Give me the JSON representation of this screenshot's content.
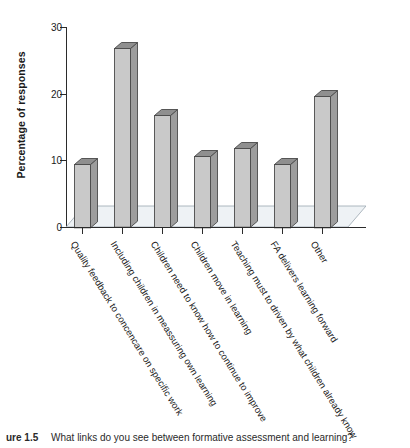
{
  "chart_data": {
    "type": "bar",
    "title": "",
    "xlabel": "",
    "ylabel": "Percentage of responses",
    "ylim": [
      0,
      30
    ],
    "yticks": [
      0,
      10,
      20,
      30
    ],
    "grid": false,
    "legend": null,
    "style": "3d-column",
    "categories": [
      "Quality feedback to concencare on specific work",
      "Including children in meassuring own learning",
      "Children need to know how to continue to improve",
      "Children move in learning",
      "Teaching must to driven by what children already know",
      "FA delivers learning forward",
      "Other"
    ],
    "values": [
      9.5,
      26.8,
      16.8,
      10.7,
      11.8,
      9.5,
      19.7
    ],
    "value_unit": "%"
  },
  "axis": {
    "y_title": "Percentage of responses",
    "y_tick_labels": [
      "0",
      "10",
      "20",
      "30"
    ]
  },
  "caption": {
    "figure_number": "ure 1.5",
    "text": "What links do you see between formative assessment and learning?"
  },
  "colors": {
    "bar_front": "#c9c9c9",
    "bar_side": "#9d9d9d",
    "bar_top": "#8f8f8f",
    "bar_outline": "#4a4a4a",
    "floor": "#eef2f5",
    "axis": "#2b2b2b",
    "text": "#1a1a1a",
    "background": "#ffffff"
  }
}
